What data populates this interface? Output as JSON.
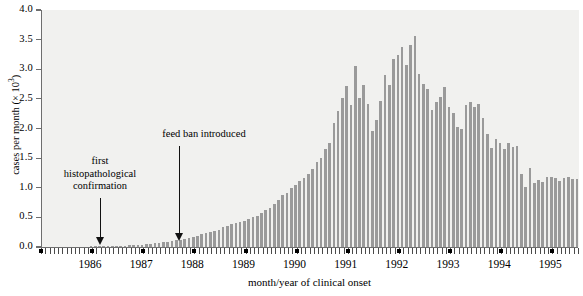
{
  "chart": {
    "type": "bar",
    "title": "",
    "xlabel": "month/year of clinical onset",
    "ylabel_text": "cases per month (× 10",
    "ylabel_exp": "3",
    "ylabel_close": ")",
    "ylim": [
      0.0,
      4.0
    ],
    "ytick_labels": [
      "0.0",
      "0.5",
      "1.0",
      "1.5",
      "2.0",
      "2.5",
      "3.0",
      "3.5",
      "4.0"
    ],
    "ytick_values": [
      0.0,
      0.5,
      1.0,
      1.5,
      2.0,
      2.5,
      3.0,
      3.5,
      4.0
    ],
    "xtick_labels": [
      "1986",
      "1987",
      "1988",
      "1989",
      "1990",
      "1991",
      "1992",
      "1993",
      "1994",
      "1995"
    ],
    "grid": false,
    "legend": "none",
    "bar_color": "#9a9a9a",
    "plot_background": "#f1f1ef",
    "axis_color": "#6e6e6e"
  },
  "annotations": [
    {
      "id": "first-histopathological-confirmation",
      "lines": [
        "first",
        "histopathological",
        "confirmation"
      ],
      "points_to_month": "1986-06"
    },
    {
      "id": "feed-ban-introduced",
      "lines": [
        "feed ban introduced"
      ],
      "points_to_month": "1988-07"
    }
  ],
  "chart_data": {
    "type": "bar",
    "title": "",
    "xlabel": "month/year of clinical onset",
    "ylabel": "cases per month (× 10³)",
    "ylim": [
      0.0,
      4.0
    ],
    "xlim": [
      "1985-07",
      "1995-12"
    ],
    "grid": false,
    "legend": "none",
    "unit": "thousands of cases per month",
    "categories": [
      "1985-07",
      "1985-08",
      "1985-09",
      "1985-10",
      "1985-11",
      "1985-12",
      "1986-01",
      "1986-02",
      "1986-03",
      "1986-04",
      "1986-05",
      "1986-06",
      "1986-07",
      "1986-08",
      "1986-09",
      "1986-10",
      "1986-11",
      "1986-12",
      "1987-01",
      "1987-02",
      "1987-03",
      "1987-04",
      "1987-05",
      "1987-06",
      "1987-07",
      "1987-08",
      "1987-09",
      "1987-10",
      "1987-11",
      "1987-12",
      "1988-01",
      "1988-02",
      "1988-03",
      "1988-04",
      "1988-05",
      "1988-06",
      "1988-07",
      "1988-08",
      "1988-09",
      "1988-10",
      "1988-11",
      "1988-12",
      "1989-01",
      "1989-02",
      "1989-03",
      "1989-04",
      "1989-05",
      "1989-06",
      "1989-07",
      "1989-08",
      "1989-09",
      "1989-10",
      "1989-11",
      "1989-12",
      "1990-01",
      "1990-02",
      "1990-03",
      "1990-04",
      "1990-05",
      "1990-06",
      "1990-07",
      "1990-08",
      "1990-09",
      "1990-10",
      "1990-11",
      "1990-12",
      "1991-01",
      "1991-02",
      "1991-03",
      "1991-04",
      "1991-05",
      "1991-06",
      "1991-07",
      "1991-08",
      "1991-09",
      "1991-10",
      "1991-11",
      "1991-12",
      "1992-01",
      "1992-02",
      "1992-03",
      "1992-04",
      "1992-05",
      "1992-06",
      "1992-07",
      "1992-08",
      "1992-09",
      "1992-10",
      "1992-11",
      "1992-12",
      "1993-01",
      "1993-02",
      "1993-03",
      "1993-04",
      "1993-05",
      "1993-06",
      "1993-07",
      "1993-08",
      "1993-09",
      "1993-10",
      "1993-11",
      "1993-12",
      "1994-01",
      "1994-02",
      "1994-03",
      "1994-04",
      "1994-05",
      "1994-06",
      "1994-07",
      "1994-08",
      "1994-09",
      "1994-10",
      "1994-11",
      "1994-12",
      "1995-01",
      "1995-02",
      "1995-03",
      "1995-04",
      "1995-05",
      "1995-06",
      "1995-07",
      "1995-08",
      "1995-09",
      "1995-10",
      "1995-11",
      "1995-12"
    ],
    "values": [
      0.0,
      0.0,
      0.0,
      0.0,
      0.0,
      0.0,
      0.0,
      0.0,
      0.0,
      0.0,
      0.0,
      0.01,
      0.01,
      0.01,
      0.01,
      0.01,
      0.01,
      0.02,
      0.02,
      0.02,
      0.03,
      0.03,
      0.04,
      0.04,
      0.05,
      0.05,
      0.06,
      0.07,
      0.08,
      0.08,
      0.1,
      0.11,
      0.12,
      0.14,
      0.16,
      0.17,
      0.19,
      0.22,
      0.24,
      0.25,
      0.27,
      0.29,
      0.33,
      0.35,
      0.39,
      0.41,
      0.43,
      0.44,
      0.48,
      0.5,
      0.53,
      0.58,
      0.62,
      0.66,
      0.73,
      0.8,
      0.88,
      0.92,
      0.99,
      1.04,
      1.11,
      1.16,
      1.24,
      1.32,
      1.44,
      1.5,
      1.66,
      1.76,
      2.09,
      2.29,
      2.52,
      2.72,
      2.39,
      3.05,
      2.51,
      2.73,
      2.41,
      1.96,
      2.14,
      2.46,
      2.9,
      2.74,
      3.17,
      3.24,
      3.37,
      3.07,
      3.41,
      3.56,
      2.92,
      2.75,
      2.66,
      2.31,
      2.45,
      2.54,
      2.7,
      2.36,
      2.27,
      2.03,
      1.99,
      2.39,
      2.44,
      2.37,
      2.41,
      2.18,
      1.9,
      1.67,
      1.82,
      1.76,
      1.66,
      1.76,
      1.69,
      1.71,
      1.23,
      1.02,
      1.34,
      1.08,
      1.13,
      1.1,
      1.18,
      1.19,
      1.16,
      1.11,
      1.17,
      1.19,
      1.15,
      1.14
    ],
    "annotations": [
      {
        "text": "first histopathological confirmation",
        "at": "1986-06"
      },
      {
        "text": "feed ban introduced",
        "at": "1988-07"
      }
    ]
  }
}
